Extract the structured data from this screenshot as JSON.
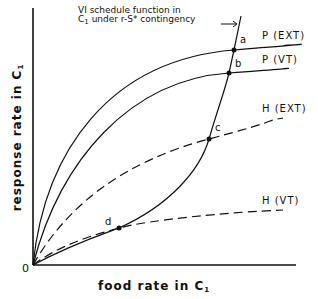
{
  "diagram": {
    "y_axis": {
      "label": "response rate in",
      "label_sub_main": "C",
      "label_sub": "1"
    },
    "x_axis": {
      "label": "food rate in",
      "label_sub_main": "C",
      "label_sub": "1"
    },
    "origin_label": "0",
    "annotation": {
      "line1": "VI  schedule function in",
      "line2_prefix": "C",
      "line2_sub": "1",
      "line2": " under r-S* contingency"
    },
    "curves": [
      {
        "id": "P-EXT",
        "label": "P (EXT)",
        "style": "solid"
      },
      {
        "id": "P-VT",
        "label": "P (VT)",
        "style": "solid"
      },
      {
        "id": "H-EXT",
        "label": "H (EXT)",
        "style": "dashed"
      },
      {
        "id": "H-VT",
        "label": "H (VT)",
        "style": "dashed"
      },
      {
        "id": "VI",
        "label": "VI schedule function",
        "style": "solid"
      }
    ],
    "points": [
      {
        "label": "a"
      },
      {
        "label": "b"
      },
      {
        "label": "c"
      },
      {
        "label": "d"
      }
    ]
  }
}
